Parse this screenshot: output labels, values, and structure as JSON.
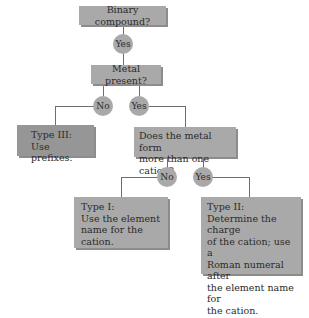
{
  "diagram": {
    "type": "flowchart",
    "nodes": {
      "binary": {
        "label": "Binary compound?"
      },
      "yes1": {
        "label": "Yes"
      },
      "metal": {
        "label": "Metal present?"
      },
      "no2": {
        "label": "No"
      },
      "yes2": {
        "label": "Yes"
      },
      "type3": {
        "label": "Type III:\nUse prefixes."
      },
      "cation": {
        "label": "Does the metal form\nmore than one cation?"
      },
      "no3": {
        "label": "No"
      },
      "yes3": {
        "label": "Yes"
      },
      "type1": {
        "label": "Type I:\nUse the element\nname for the cation."
      },
      "type2": {
        "label": "Type II:\nDetermine the charge\nof the cation; use a\nRoman numeral after\nthe element name for\nthe cation."
      }
    },
    "edges": [
      [
        "binary",
        "yes1"
      ],
      [
        "yes1",
        "metal"
      ],
      [
        "metal",
        "no2"
      ],
      [
        "no2",
        "type3"
      ],
      [
        "metal",
        "yes2"
      ],
      [
        "yes2",
        "cation"
      ],
      [
        "cation",
        "no3"
      ],
      [
        "no3",
        "type1"
      ],
      [
        "cation",
        "yes3"
      ],
      [
        "yes3",
        "type2"
      ]
    ],
    "colors": {
      "box": "#a9a9a9",
      "box_dark": "#969696",
      "line": "#6e6e6e",
      "text": "#2b2b2b"
    }
  }
}
